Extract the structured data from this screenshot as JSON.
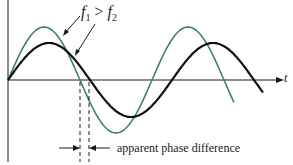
{
  "diagram": {
    "axis_label_t": "t",
    "annotation_freq": {
      "f1": "f",
      "sub1": "1",
      "op": " > ",
      "f2": "f",
      "sub2": "2"
    },
    "annotation_phase": "apparent phase difference",
    "colors": {
      "wave1": "#3d7f6b",
      "wave2": "#111111",
      "axis": "#1a1a1a"
    },
    "waves": [
      {
        "name": "f1",
        "color": "#3d7f6b",
        "amplitude_px": 53,
        "period_px": 144
      },
      {
        "name": "f2",
        "color": "#111111",
        "amplitude_px": 37,
        "period_px": 164
      }
    ]
  }
}
